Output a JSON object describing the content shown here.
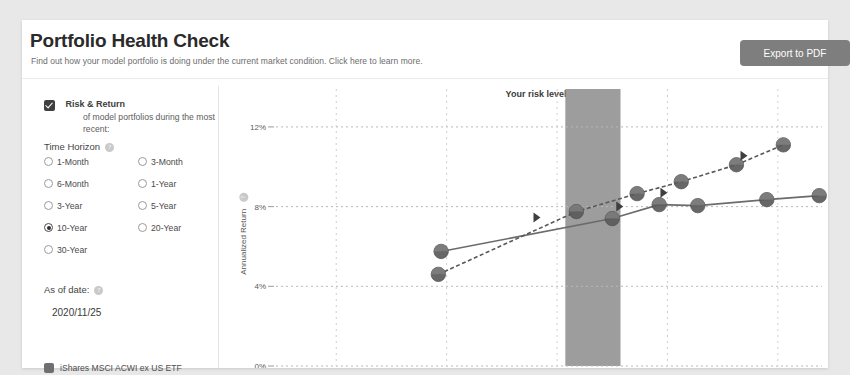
{
  "header": {
    "title": "Portfolio Health Check",
    "subtitle": "Find out how your model portfolio is doing under the current market condition. Click here to learn more.",
    "export_label": "Export to PDF"
  },
  "panel": {
    "checkbox": {
      "label": "Risk & Return",
      "description": "of model portfolios during the most recent:",
      "checked": true
    },
    "time_horizon": {
      "label": "Time Horizon",
      "info_icon": "question-icon",
      "selected": "10-Year",
      "options": [
        "1-Month",
        "3-Month",
        "6-Month",
        "1-Year",
        "3-Year",
        "5-Year",
        "10-Year",
        "20-Year",
        "30-Year"
      ]
    },
    "as_of_date": {
      "label": "As of date:",
      "info_icon": "question-icon",
      "value": "2020/11/25"
    },
    "legend": {
      "swatch_color": "#6f6f6f",
      "label": "iShares MSCI ACWI ex US ETF"
    }
  },
  "chart_data": {
    "type": "line",
    "title": "Your risk level",
    "xlabel": "",
    "ylabel": "Annualized Return",
    "ytick_labels": [
      "0%",
      "4%",
      "8%",
      "12%"
    ],
    "ytick_values": [
      0,
      4,
      8,
      12
    ],
    "ylim": [
      0,
      13
    ],
    "xlim": [
      0,
      100
    ],
    "grid": "dotted",
    "legend_position": "left-panel",
    "band": {
      "name": "Your risk level",
      "x_start": 53.5,
      "x_end": 63.5,
      "color": "#8c8c8c"
    },
    "series": [
      {
        "name": "Model portfolios (efficient frontier)",
        "style": "solid",
        "color": "#6b6b6b",
        "marker": "circle",
        "points": [
          {
            "x": 31.0,
            "y": 5.75
          },
          {
            "x": 62.0,
            "y": 7.4
          },
          {
            "x": 70.5,
            "y": 8.1
          },
          {
            "x": 77.5,
            "y": 8.05
          },
          {
            "x": 90.0,
            "y": 8.35
          },
          {
            "x": 99.5,
            "y": 8.55
          }
        ]
      },
      {
        "name": "Your portfolio path",
        "style": "dashed",
        "color": "#585858",
        "marker": "circle",
        "points": [
          {
            "x": 30.5,
            "y": 4.6
          },
          {
            "x": 55.5,
            "y": 7.75
          },
          {
            "x": 66.5,
            "y": 8.65
          },
          {
            "x": 74.5,
            "y": 9.25
          },
          {
            "x": 84.5,
            "y": 10.1
          },
          {
            "x": 93.0,
            "y": 11.1
          }
        ]
      }
    ],
    "arrows": [
      {
        "x": 49.0,
        "y": 7.45,
        "dir": "left"
      },
      {
        "x": 64.0,
        "y": 8.0,
        "dir": "left"
      },
      {
        "x": 72.0,
        "y": 8.7,
        "dir": "left"
      },
      {
        "x": 86.5,
        "y": 10.55,
        "dir": "left"
      }
    ]
  }
}
